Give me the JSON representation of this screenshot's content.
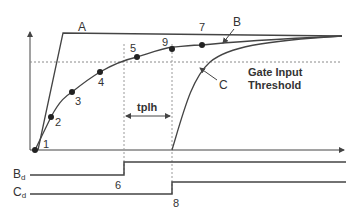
{
  "diagram": {
    "curves": {
      "A": {
        "label": "A"
      },
      "B": {
        "label": "B"
      },
      "C": {
        "label": "C"
      }
    },
    "threshold_label_line1": "Gate Input",
    "threshold_label_line2": "Threshold",
    "tplh_label": "tplh",
    "points": [
      {
        "id": "1",
        "label": "1"
      },
      {
        "id": "2",
        "label": "2"
      },
      {
        "id": "3",
        "label": "3"
      },
      {
        "id": "4",
        "label": "4"
      },
      {
        "id": "5",
        "label": "5"
      },
      {
        "id": "9",
        "label": "9"
      },
      {
        "id": "7",
        "label": "7"
      }
    ],
    "edge_labels": {
      "six": "6",
      "eight": "8"
    },
    "signals": {
      "bd_main": "B",
      "bd_sub": "d",
      "cd_main": "C",
      "cd_sub": "d"
    },
    "colors": {
      "line": "#444444",
      "grid": "#9a9a9a",
      "text": "#333333"
    }
  }
}
